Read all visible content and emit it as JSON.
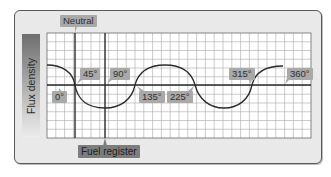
{
  "diagram": {
    "y_axis_label": "Flux density",
    "top_marker": "Neutral",
    "bottom_marker": "Fuel register",
    "angle_labels": [
      "0°",
      "45°",
      "90°",
      "135°",
      "225°",
      "315°",
      "360°"
    ],
    "colors": {
      "panel_bg": "#e9e9e9",
      "grid_line": "#9a9a9a",
      "axis_line": "#2a2a2a",
      "curve": "#2a2a2a",
      "label_bg": "#a9a9a9",
      "marker_label_bg": "#7d7d7d"
    },
    "grid": {
      "columns": 30,
      "rows": 12
    }
  }
}
